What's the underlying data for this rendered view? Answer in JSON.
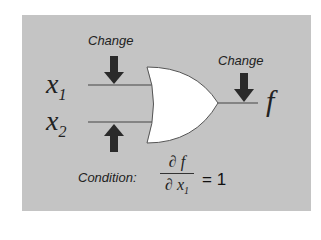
{
  "diagram": {
    "type": "logic-gate",
    "gate": "OR",
    "colors": {
      "panel": "#c4c4c4",
      "gate_fill": "#ffffff",
      "arrow": "#2a2a2a",
      "line": "#444444"
    },
    "inputs": [
      {
        "name": "x",
        "subscript": "1",
        "change_label": "Change",
        "arrow": "down"
      },
      {
        "name": "x",
        "subscript": "2",
        "change_label": "",
        "arrow": "up"
      }
    ],
    "output": {
      "name": "f",
      "change_label": "Change",
      "arrow": "down"
    },
    "condition": {
      "label": "Condition:",
      "numerator": "∂ f",
      "denominator_symbol": "∂ x",
      "denominator_subscript": "1",
      "equals": "= 1"
    }
  }
}
